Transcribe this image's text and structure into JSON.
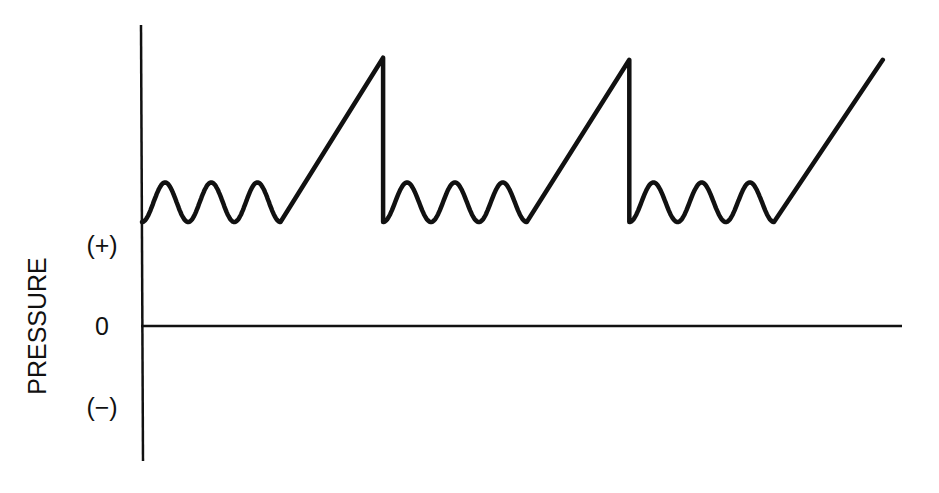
{
  "chart_data": {
    "type": "line",
    "title": "",
    "xlabel": "",
    "ylabel": "PRESSURE",
    "y_tick_labels": [
      {
        "label": "(+)",
        "value": 0.78
      },
      {
        "label": "0",
        "value": 0
      },
      {
        "label": "(−)",
        "value": -0.78
      }
    ],
    "xlim": [
      0,
      7.4
    ],
    "ylim": [
      -1.3,
      2.9
    ],
    "grid": false,
    "legend": "none",
    "zero_line": true,
    "series": [
      {
        "name": "pressure-waveform",
        "color": "#111111",
        "description": "Three cycles: small oscillations near a positive baseline followed by a linear ramp to a peak and a sharp vertical drop",
        "cycles": [
          {
            "start": 0.0,
            "oscillations": 3,
            "osc_end": 1.35,
            "ramp_end": 2.35,
            "baseline": 1.0,
            "osc_peak": 1.38,
            "ramp_peak": 2.58,
            "drop": true
          },
          {
            "start": 2.35,
            "oscillations": 3,
            "osc_end": 3.75,
            "ramp_end": 4.75,
            "baseline": 1.0,
            "osc_peak": 1.38,
            "ramp_peak": 2.56,
            "drop": true
          },
          {
            "start": 4.75,
            "oscillations": 3,
            "osc_end": 6.16,
            "ramp_end": 7.22,
            "baseline": 1.0,
            "osc_peak": 1.38,
            "ramp_peak": 2.56,
            "drop": false
          }
        ]
      }
    ]
  }
}
